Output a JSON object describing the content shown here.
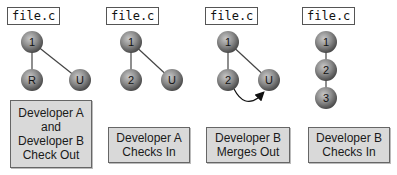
{
  "colors": {
    "node_fill_light": "#b8b8b8",
    "node_fill_dark": "#555555",
    "edge": "#444444",
    "caption_bg": "#d9d9d9",
    "caption_border": "#666666"
  },
  "panels": [
    {
      "file_label": "file.c",
      "nodes": [
        "1",
        "R",
        "U"
      ],
      "caption": "Developer A\nand\nDeveloper B\nCheck Out"
    },
    {
      "file_label": "file.c",
      "nodes": [
        "1",
        "2",
        "U"
      ],
      "caption": "Developer A\nChecks In"
    },
    {
      "file_label": "file.c",
      "nodes": [
        "1",
        "2",
        "U"
      ],
      "caption": "Developer B\nMerges Out"
    },
    {
      "file_label": "file.c",
      "nodes": [
        "1",
        "2",
        "3"
      ],
      "caption": "Developer B\nChecks In"
    }
  ]
}
